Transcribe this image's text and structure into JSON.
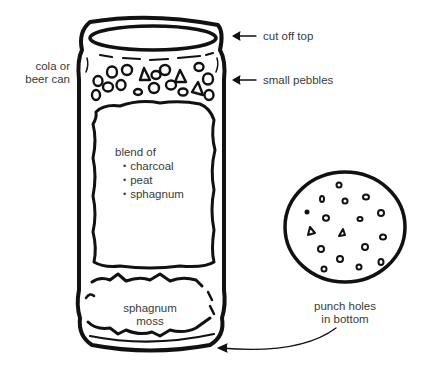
{
  "diagram": {
    "labels": {
      "can": [
        "cola or",
        "beer can"
      ],
      "cut_off_top": "cut off top",
      "small_pebbles": "small pebbles",
      "blend_heading": "blend of",
      "blend_items": [
        "charcoal",
        "peat",
        "sphagnum"
      ],
      "bottom_layer": [
        "sphagnum",
        "moss"
      ],
      "punch_holes": [
        "punch holes",
        "in bottom"
      ]
    },
    "colors": {
      "ink": "#111111",
      "text": "#3a3a3a",
      "background": "#ffffff"
    }
  }
}
